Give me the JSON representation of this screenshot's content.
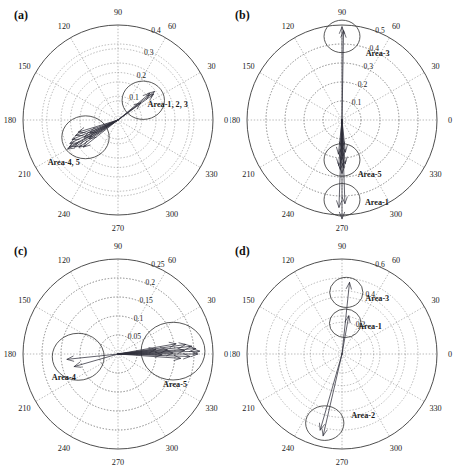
{
  "figure": {
    "type": "multi-panel-polar-vector-plot",
    "panels_count": 4,
    "background_color": "#ffffff",
    "axis_color": "#3a3a3a",
    "grid_color": "#8a8a8a",
    "arrow_color": "#2e2e3a"
  },
  "chart_data": [
    {
      "id": "a",
      "type": "scatter",
      "subtype": "polar-vector",
      "title": "(a)",
      "xlabel": "",
      "ylabel": "",
      "angle_unit": "degrees",
      "angular_ticks": [
        0,
        30,
        60,
        90,
        120,
        150,
        180,
        210,
        240,
        270,
        300,
        330
      ],
      "angular_tick_labels": [
        "0",
        "30",
        "60",
        "90",
        "120",
        "150",
        "180",
        "210",
        "240",
        "270",
        "300",
        "330"
      ],
      "radial_ticks": [
        0.1,
        0.2,
        0.3,
        0.4
      ],
      "radial_tick_labels": [
        "0.1",
        "0.2",
        "0.3",
        "0.4"
      ],
      "rlim": [
        0,
        0.4
      ],
      "grid": true,
      "legend_position": "none",
      "annotations": [
        {
          "text": "Area-1, 2, 3",
          "angle_deg": 18,
          "radius": 0.22
        },
        {
          "text": "Area-4, 5",
          "angle_deg": 218,
          "radius": 0.29
        }
      ],
      "cluster_circles": [
        {
          "label": "Area-1, 2, 3",
          "center_angle_deg": 38,
          "center_radius": 0.135,
          "circle_radius_r": 0.085
        },
        {
          "label": "Area-4, 5",
          "center_angle_deg": 208,
          "center_radius": 0.155,
          "circle_radius_r": 0.095
        }
      ],
      "vectors": [
        {
          "angle_deg": 38,
          "r": 0.195,
          "group": "Area-1, 2, 3"
        },
        {
          "angle_deg": 36,
          "r": 0.185,
          "group": "Area-1, 2, 3"
        },
        {
          "angle_deg": 40,
          "r": 0.175,
          "group": "Area-1, 2, 3"
        },
        {
          "angle_deg": 37,
          "r": 0.12,
          "group": "Area-1, 2, 3"
        },
        {
          "angle_deg": 206,
          "r": 0.225,
          "group": "Area-4, 5"
        },
        {
          "angle_deg": 209,
          "r": 0.235,
          "group": "Area-4, 5"
        },
        {
          "angle_deg": 212,
          "r": 0.215,
          "group": "Area-4, 5"
        },
        {
          "angle_deg": 203,
          "r": 0.21,
          "group": "Area-4, 5"
        },
        {
          "angle_deg": 215,
          "r": 0.2,
          "group": "Area-4, 5"
        },
        {
          "angle_deg": 200,
          "r": 0.19,
          "group": "Area-4, 5"
        },
        {
          "angle_deg": 218,
          "r": 0.185,
          "group": "Area-4, 5"
        },
        {
          "angle_deg": 197,
          "r": 0.175,
          "group": "Area-4, 5"
        },
        {
          "angle_deg": 210,
          "r": 0.245,
          "group": "Area-4, 5"
        },
        {
          "angle_deg": 207,
          "r": 0.16,
          "group": "Area-4, 5"
        },
        {
          "angle_deg": 213,
          "r": 0.145,
          "group": "Area-4, 5"
        },
        {
          "angle_deg": 204,
          "r": 0.13,
          "group": "Area-4, 5"
        }
      ]
    },
    {
      "id": "b",
      "type": "scatter",
      "subtype": "polar-vector",
      "title": "(b)",
      "xlabel": "",
      "ylabel": "",
      "angle_unit": "degrees",
      "angular_ticks": [
        0,
        30,
        60,
        90,
        120,
        150,
        180,
        210,
        240,
        270,
        300,
        330
      ],
      "angular_tick_labels": [
        "0",
        "30",
        "60",
        "90",
        "120",
        "150",
        "180",
        "210",
        "240",
        "270",
        "300",
        "330"
      ],
      "radial_ticks": [
        0.1,
        0.2,
        0.3,
        0.4,
        0.5
      ],
      "radial_tick_labels": [
        "0.1",
        "0.2",
        "0.3",
        "0.4",
        "0.5"
      ],
      "rlim": [
        0,
        0.5
      ],
      "grid": true,
      "legend_position": "none",
      "annotations": [
        {
          "text": "Area-3",
          "angle_deg": 62,
          "radius": 0.4
        },
        {
          "text": "Area-5",
          "angle_deg": 297,
          "radius": 0.32
        },
        {
          "text": "Area-1",
          "angle_deg": 293,
          "radius": 0.47
        }
      ],
      "cluster_circles": [
        {
          "label": "Area-3",
          "center_angle_deg": 90,
          "center_radius": 0.44,
          "circle_radius_r": 0.09
        },
        {
          "label": "Area-5",
          "center_angle_deg": 270,
          "center_radius": 0.21,
          "circle_radius_r": 0.09
        },
        {
          "label": "Area-1",
          "center_angle_deg": 270,
          "center_radius": 0.42,
          "circle_radius_r": 0.09
        }
      ],
      "vectors": [
        {
          "angle_deg": 90,
          "r": 0.49,
          "group": "Area-3"
        },
        {
          "angle_deg": 89,
          "r": 0.47,
          "group": "Area-3"
        },
        {
          "angle_deg": 270,
          "r": 0.52,
          "group": "Area-1"
        },
        {
          "angle_deg": 268,
          "r": 0.46,
          "group": "Area-1"
        },
        {
          "angle_deg": 272,
          "r": 0.44,
          "group": "Area-1"
        },
        {
          "angle_deg": 270,
          "r": 0.28,
          "group": "Area-5"
        },
        {
          "angle_deg": 268,
          "r": 0.26,
          "group": "Area-5"
        },
        {
          "angle_deg": 272,
          "r": 0.25,
          "group": "Area-5"
        },
        {
          "angle_deg": 266,
          "r": 0.24,
          "group": "Area-5"
        },
        {
          "angle_deg": 274,
          "r": 0.23,
          "group": "Area-5"
        },
        {
          "angle_deg": 269,
          "r": 0.21,
          "group": "Area-5"
        },
        {
          "angle_deg": 271,
          "r": 0.19,
          "group": "Area-5"
        },
        {
          "angle_deg": 264,
          "r": 0.18,
          "group": "Area-5"
        },
        {
          "angle_deg": 276,
          "r": 0.17,
          "group": "Area-5"
        },
        {
          "angle_deg": 270,
          "r": 0.15,
          "group": "Area-5"
        }
      ]
    },
    {
      "id": "c",
      "type": "scatter",
      "subtype": "polar-vector",
      "title": "(c)",
      "xlabel": "",
      "ylabel": "",
      "angle_unit": "degrees",
      "angular_ticks": [
        0,
        30,
        60,
        90,
        120,
        150,
        180,
        210,
        240,
        270,
        300,
        330
      ],
      "angular_tick_labels": [
        "0",
        "30",
        "60",
        "90",
        "120",
        "150",
        "180",
        "210",
        "240",
        "270",
        "300",
        "330"
      ],
      "radial_ticks": [
        0.05,
        0.1,
        0.15,
        0.2,
        0.25
      ],
      "radial_tick_labels": [
        "0.05",
        "0.1",
        "0.15",
        "0.2",
        "0.25"
      ],
      "rlim": [
        0,
        0.25
      ],
      "grid": true,
      "legend_position": "none",
      "annotations": [
        {
          "text": "Area-4",
          "angle_deg": 203,
          "radius": 0.155
        },
        {
          "text": "Area-5",
          "angle_deg": 332,
          "radius": 0.17
        }
      ],
      "cluster_circles": [
        {
          "label": "Area-4",
          "center_angle_deg": 184,
          "center_radius": 0.105,
          "circle_radius_r": 0.065
        },
        {
          "label": "Area-5",
          "center_angle_deg": 3,
          "center_radius": 0.145,
          "circle_radius_r": 0.08
        }
      ],
      "vectors": [
        {
          "angle_deg": 186,
          "r": 0.135,
          "group": "Area-4"
        },
        {
          "angle_deg": 196,
          "r": 0.12,
          "group": "Area-4"
        },
        {
          "angle_deg": 2,
          "r": 0.215,
          "group": "Area-5"
        },
        {
          "angle_deg": 0,
          "r": 0.21,
          "group": "Area-5"
        },
        {
          "angle_deg": 4,
          "r": 0.205,
          "group": "Area-5"
        },
        {
          "angle_deg": 6,
          "r": 0.195,
          "group": "Area-5"
        },
        {
          "angle_deg": 358,
          "r": 0.19,
          "group": "Area-5"
        },
        {
          "angle_deg": 8,
          "r": 0.18,
          "group": "Area-5"
        },
        {
          "angle_deg": 3,
          "r": 0.175,
          "group": "Area-5"
        },
        {
          "angle_deg": 356,
          "r": 0.165,
          "group": "Area-5"
        },
        {
          "angle_deg": 10,
          "r": 0.155,
          "group": "Area-5"
        },
        {
          "angle_deg": 1,
          "r": 0.145,
          "group": "Area-5"
        },
        {
          "angle_deg": 5,
          "r": 0.13,
          "group": "Area-5"
        },
        {
          "angle_deg": 359,
          "r": 0.115,
          "group": "Area-5"
        },
        {
          "angle_deg": 7,
          "r": 0.1,
          "group": "Area-5"
        }
      ]
    },
    {
      "id": "d",
      "type": "scatter",
      "subtype": "polar-vector",
      "title": "(d)",
      "xlabel": "",
      "ylabel": "",
      "angle_unit": "degrees",
      "angular_ticks": [
        0,
        30,
        60,
        90,
        120,
        150,
        180,
        210,
        240,
        270,
        300,
        330
      ],
      "angular_tick_labels": [
        "0",
        "30",
        "60",
        "90",
        "120",
        "150",
        "180",
        "210",
        "240",
        "270",
        "300",
        "330"
      ],
      "radial_ticks": [
        0.2,
        0.4,
        0.6
      ],
      "radial_tick_labels": [
        "0.2",
        "0.4",
        "0.6"
      ],
      "rlim": [
        0,
        0.6
      ],
      "grid": true,
      "legend_position": "none",
      "annotations": [
        {
          "text": "Area-3",
          "angle_deg": 58,
          "radius": 0.42
        },
        {
          "text": "Area-1",
          "angle_deg": 45,
          "radius": 0.25
        },
        {
          "text": "Area-2",
          "angle_deg": 289,
          "radius": 0.41
        }
      ],
      "cluster_circles": [
        {
          "label": "Area-3",
          "center_angle_deg": 86,
          "center_radius": 0.39,
          "circle_radius_r": 0.1
        },
        {
          "label": "Area-1",
          "center_angle_deg": 84,
          "center_radius": 0.195,
          "circle_radius_r": 0.095
        },
        {
          "label": "Area-2",
          "center_angle_deg": 256,
          "center_radius": 0.45,
          "circle_radius_r": 0.115
        }
      ],
      "vectors": [
        {
          "angle_deg": 84,
          "r": 0.455,
          "group": "Area-3"
        },
        {
          "angle_deg": 80,
          "r": 0.245,
          "group": "Area-1"
        },
        {
          "angle_deg": 257,
          "r": 0.53,
          "group": "Area-2"
        },
        {
          "angle_deg": 254,
          "r": 0.5,
          "group": "Area-2"
        }
      ]
    }
  ]
}
